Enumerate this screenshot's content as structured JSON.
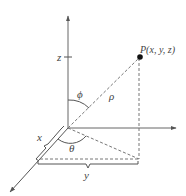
{
  "diagram": {
    "labels": {
      "z_axis": "z",
      "point": "P(x, y, z)",
      "phi": "ϕ",
      "rho": "ρ",
      "theta": "θ",
      "x_axis": "x",
      "y_axis": "y"
    },
    "colors": {
      "line": "#555555",
      "point": "#111111",
      "text": "#444444"
    },
    "geometry": {
      "origin": [
        68,
        128
      ],
      "z_axis_end": [
        68,
        15
      ],
      "y_axis_end": [
        176,
        128
      ],
      "x_axis_end": [
        10,
        192
      ],
      "point_P": [
        140,
        57
      ],
      "projection": [
        139,
        159
      ]
    }
  }
}
